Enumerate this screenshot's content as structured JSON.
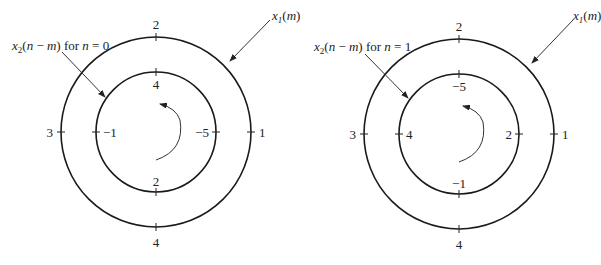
{
  "diagrams": [
    {
      "id": "n0",
      "outer_label": "x1(m)",
      "inner_label_prefix": "x2(n − m) for ",
      "inner_label_n": "n = 0",
      "outer": {
        "top": "2",
        "left": "3",
        "right": "1",
        "bottom": "4"
      },
      "inner": {
        "top": "4",
        "left": "−1",
        "right": "−5",
        "bottom": "2"
      }
    },
    {
      "id": "n1",
      "outer_label": "x1(m)",
      "inner_label_prefix": "x2(n − m) for ",
      "inner_label_n": "n = 1",
      "outer": {
        "top": "2",
        "left": "3",
        "right": "1",
        "bottom": "4"
      },
      "inner": {
        "top": "−5",
        "left": "4",
        "right": "2",
        "bottom": "−1"
      }
    }
  ],
  "colors": {
    "stroke": "#1a1a1a",
    "text": "#222222"
  }
}
